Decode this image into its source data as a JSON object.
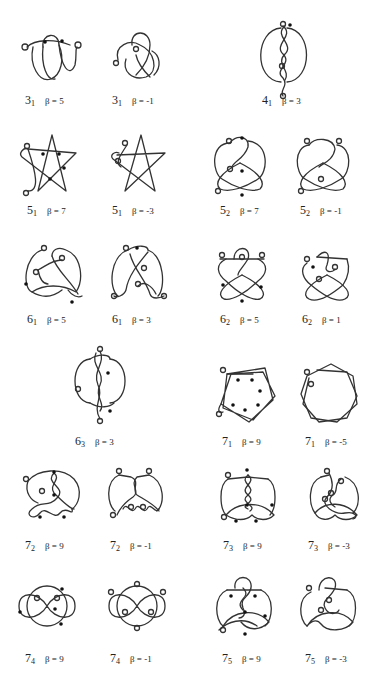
{
  "figure": {
    "background": "#ffffff",
    "stroke_color": "#333333",
    "dot_color": "#111111",
    "items": [
      {
        "knot": "3",
        "index": "1",
        "beta_label": "β = 5",
        "beta": 5,
        "dots": 2,
        "x": 15,
        "y": 10,
        "lx": 25,
        "ly": 95
      },
      {
        "knot": "3",
        "index": "1",
        "beta_label": "β = -1",
        "beta": -1,
        "dots": 0,
        "x": 110,
        "y": 10,
        "lx": 112,
        "ly": 95
      },
      {
        "knot": "4",
        "index": "1",
        "beta_label": "β = 3",
        "beta": 3,
        "dots": 1,
        "x": 255,
        "y": 20,
        "lx": 262,
        "ly": 95
      },
      {
        "knot": "5",
        "index": "1",
        "beta_label": "β = 7",
        "beta": 7,
        "dots": 4,
        "x": 18,
        "y": 130,
        "lx": 27,
        "ly": 205
      },
      {
        "knot": "5",
        "index": "1",
        "beta_label": "β = -3",
        "beta": -3,
        "dots": 0,
        "x": 105,
        "y": 130,
        "lx": 112,
        "ly": 205
      },
      {
        "knot": "5",
        "index": "2",
        "beta_label": "β = 7",
        "beta": 7,
        "dots": 3,
        "x": 210,
        "y": 130,
        "lx": 220,
        "ly": 205
      },
      {
        "knot": "5",
        "index": "2",
        "beta_label": "β = -1",
        "beta": -1,
        "dots": 0,
        "x": 293,
        "y": 130,
        "lx": 300,
        "ly": 205
      },
      {
        "knot": "6",
        "index": "1",
        "beta_label": "β = 5",
        "beta": 5,
        "dots": 2,
        "x": 22,
        "y": 240,
        "lx": 27,
        "ly": 314
      },
      {
        "knot": "6",
        "index": "1",
        "beta_label": "β = 3",
        "beta": 3,
        "dots": 1,
        "x": 108,
        "y": 240,
        "lx": 112,
        "ly": 314
      },
      {
        "knot": "6",
        "index": "2",
        "beta_label": "β = 5",
        "beta": 5,
        "dots": 3,
        "x": 212,
        "y": 240,
        "lx": 220,
        "ly": 314
      },
      {
        "knot": "6",
        "index": "2",
        "beta_label": "β = 1",
        "beta": 1,
        "dots": 1,
        "x": 297,
        "y": 240,
        "lx": 302,
        "ly": 314
      },
      {
        "knot": "6",
        "index": "3",
        "beta_label": "β = 3",
        "beta": 3,
        "dots": 2,
        "x": 70,
        "y": 345,
        "lx": 75,
        "ly": 436
      },
      {
        "knot": "7",
        "index": "1",
        "beta_label": "β = 9",
        "beta": 9,
        "dots": 7,
        "x": 213,
        "y": 360,
        "lx": 222,
        "ly": 436
      },
      {
        "knot": "7",
        "index": "1",
        "beta_label": "β = -5",
        "beta": -5,
        "dots": 0,
        "x": 297,
        "y": 360,
        "lx": 305,
        "ly": 436
      },
      {
        "knot": "7",
        "index": "2",
        "beta_label": "β = 9",
        "beta": 9,
        "dots": 4,
        "x": 18,
        "y": 465,
        "lx": 25,
        "ly": 540
      },
      {
        "knot": "7",
        "index": "2",
        "beta_label": "β = -1",
        "beta": -1,
        "dots": 0,
        "x": 105,
        "y": 465,
        "lx": 110,
        "ly": 540
      },
      {
        "knot": "7",
        "index": "3",
        "beta_label": "β = 9",
        "beta": 9,
        "dots": 5,
        "x": 218,
        "y": 465,
        "lx": 223,
        "ly": 540
      },
      {
        "knot": "7",
        "index": "3",
        "beta_label": "β = -3",
        "beta": -3,
        "dots": 0,
        "x": 305,
        "y": 465,
        "lx": 308,
        "ly": 540
      },
      {
        "knot": "7",
        "index": "4",
        "beta_label": "β = 9",
        "beta": 9,
        "dots": 4,
        "x": 15,
        "y": 580,
        "lx": 25,
        "ly": 653
      },
      {
        "knot": "7",
        "index": "4",
        "beta_label": "β = -1",
        "beta": -1,
        "dots": 0,
        "x": 105,
        "y": 580,
        "lx": 110,
        "ly": 653
      },
      {
        "knot": "7",
        "index": "5",
        "beta_label": "β = 9",
        "beta": 9,
        "dots": 5,
        "x": 213,
        "y": 570,
        "lx": 222,
        "ly": 653
      },
      {
        "knot": "7",
        "index": "5",
        "beta_label": "β = -3",
        "beta": -3,
        "dots": 0,
        "x": 297,
        "y": 570,
        "lx": 305,
        "ly": 653
      }
    ]
  }
}
